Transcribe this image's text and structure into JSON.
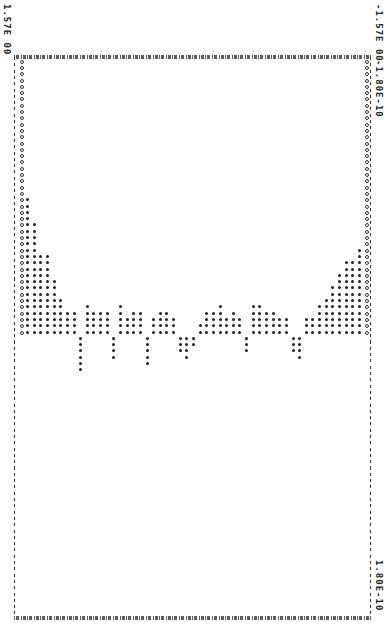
{
  "labels": {
    "top_left": "1.57E 00",
    "top_right": "-1.57E 00",
    "right_upper": "-1.80E-10",
    "right_lower": "1.80E-10"
  },
  "chart_data": {
    "type": "bar",
    "title": "",
    "orientation": "rotated line-printer plot (x axis runs horizontally from 1.57E 00 at left to -1.57E 00 at right; value axis runs vertically from -1.80E-10 at top to 1.80E-10 at bottom)",
    "xlabel": "",
    "ylabel": "",
    "xlim": [
      1.57,
      -1.57
    ],
    "ylim": [
      -1.8e-10,
      1.8e-10
    ],
    "grid": false,
    "markers": {
      "edge_columns": "O",
      "interior_columns": "*"
    },
    "column_count": 53,
    "values_in_dot_rows": [
      44,
      22,
      18,
      13,
      13,
      9,
      6,
      4,
      4,
      -6,
      5,
      4,
      4,
      4,
      -4,
      5,
      3,
      4,
      4,
      -5,
      3,
      4,
      4,
      3,
      -3,
      -4,
      -2,
      2,
      4,
      4,
      5,
      3,
      4,
      3,
      -3,
      5,
      5,
      4,
      4,
      3,
      3,
      -3,
      -4,
      3,
      3,
      5,
      6,
      8,
      10,
      12,
      12,
      14,
      44
    ],
    "note": "values are heights in printer dot rows above (+) or below (-) the zero baseline; edge columns are full-height O markers"
  }
}
